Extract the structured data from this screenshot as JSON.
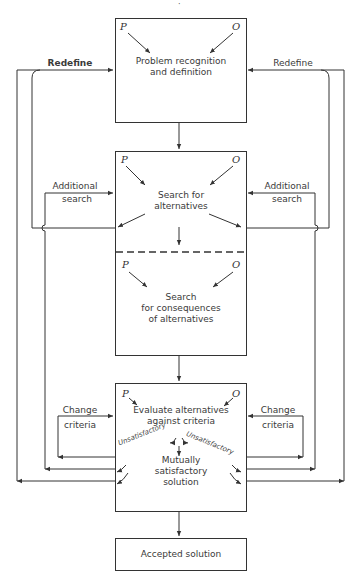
{
  "diagram": {
    "top_fragment": "·",
    "boxes": {
      "problem": {
        "p": "P",
        "o": "O",
        "line1": "Problem recognition",
        "line2": "and definition"
      },
      "search_alternatives": {
        "p": "P",
        "o": "O",
        "line1": "Search for",
        "line2": "alternatives"
      },
      "search_consequences": {
        "p": "P",
        "o": "O",
        "line1": "Search",
        "line2": "for consequences",
        "line3": "of alternatives"
      },
      "evaluate": {
        "p": "P",
        "o": "O",
        "line1": "Evaluate alternatives",
        "line2": "against criteria",
        "unsat_left": "Unsatisfactory",
        "unsat_right": "Unsatisfactory",
        "result1": "Mutually",
        "result2": "satisfactory",
        "result3": "solution"
      },
      "accepted": {
        "label": "Accepted solution"
      }
    },
    "feedback_labels": {
      "redefine_left": "Redefine",
      "redefine_right": "Redefine",
      "additional_left_1": "Additional",
      "additional_left_2": "search",
      "additional_right_1": "Additional",
      "additional_right_2": "search",
      "change_left_1": "Change",
      "change_left_2": "criteria",
      "change_right_1": "Change",
      "change_right_2": "criteria"
    },
    "caption_fragment": ""
  },
  "colors": {
    "ink": "#333333",
    "background": "#ffffff"
  }
}
